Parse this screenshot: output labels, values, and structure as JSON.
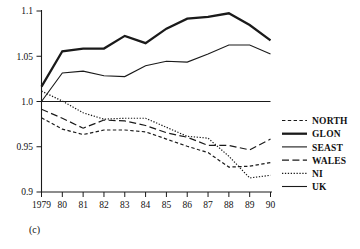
{
  "figure": {
    "caption": "(c)"
  },
  "axes": {
    "y_ticks": [
      "1.1",
      "1.05",
      "1.0",
      "0.95",
      "0.9"
    ],
    "x_ticks": [
      "1979",
      "80",
      "81",
      "82",
      "83",
      "84",
      "85",
      "86",
      "87",
      "88",
      "89",
      "90"
    ]
  },
  "legend": {
    "entries": [
      {
        "label": "NORTH",
        "style": "dashed"
      },
      {
        "label": "GLON",
        "style": "thick-solid"
      },
      {
        "label": "SEAST",
        "style": "solid"
      },
      {
        "label": "WALES",
        "style": "long-dashed"
      },
      {
        "label": "NI",
        "style": "dotted"
      },
      {
        "label": "UK",
        "style": "solid"
      }
    ]
  },
  "chart_data": {
    "type": "line",
    "title": "",
    "subtitle": "",
    "xlabel": "",
    "ylabel": "",
    "xlim": [
      1979,
      1990
    ],
    "ylim": [
      0.9,
      1.1
    ],
    "grid": false,
    "legend_position": "right",
    "x": [
      1979,
      1980,
      1981,
      1982,
      1983,
      1984,
      1985,
      1986,
      1987,
      1988,
      1989,
      1990
    ],
    "categories": [
      "1979",
      "80",
      "81",
      "82",
      "83",
      "84",
      "85",
      "86",
      "87",
      "88",
      "89",
      "90"
    ],
    "series": [
      {
        "name": "NORTH",
        "style": "dashed",
        "values": [
          0.982,
          0.9695,
          0.9635,
          0.9685,
          0.9685,
          0.9665,
          0.9585,
          0.9505,
          0.9435,
          0.9275,
          0.9285,
          0.9325
        ]
      },
      {
        "name": "GLON",
        "style": "thick-solid",
        "values": [
          1.0165,
          1.0555,
          1.0585,
          1.0585,
          1.0725,
          1.0645,
          1.0805,
          1.0915,
          1.0935,
          1.0975,
          1.0845,
          1.0675
        ]
      },
      {
        "name": "SEAST",
        "style": "solid",
        "values": [
          1.0,
          1.0315,
          1.0335,
          1.0285,
          1.0275,
          1.0395,
          1.0445,
          1.0435,
          1.0525,
          1.0625,
          1.0625,
          1.0525
        ]
      },
      {
        "name": "WALES",
        "style": "long-dashed",
        "values": [
          0.9915,
          0.9815,
          0.9705,
          0.9795,
          0.9785,
          0.9735,
          0.9655,
          0.9605,
          0.9515,
          0.9515,
          0.9465,
          0.9585
        ]
      },
      {
        "name": "NI",
        "style": "dotted",
        "values": [
          1.0115,
          1.0005,
          0.9875,
          0.9805,
          0.9815,
          0.9815,
          0.9715,
          0.9615,
          0.9595,
          0.9395,
          0.9155,
          0.9185
        ]
      },
      {
        "name": "UK",
        "style": "solid",
        "values": [
          1.0,
          1.0,
          1.0,
          1.0,
          1.0,
          1.0,
          1.0,
          1.0,
          1.0,
          1.0,
          1.0,
          1.0
        ]
      }
    ]
  }
}
